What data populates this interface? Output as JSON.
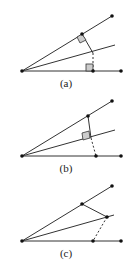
{
  "figures": [
    {
      "id": "a",
      "label": "(a)"
    },
    {
      "id": "b",
      "label": "(b)"
    },
    {
      "id": "c",
      "label": "(c)"
    }
  ]
}
